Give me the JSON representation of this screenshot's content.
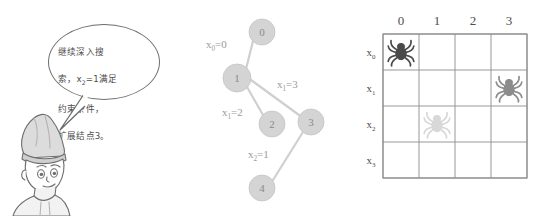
{
  "scene": {
    "title": "Backtracking search tree and n-queens style placement board",
    "background_color": "#ffffff"
  },
  "character": {
    "name": "cartoon-boy-with-pointed-cap",
    "speech_bubble": {
      "text_line_1": "继续深入搜",
      "text_line_2_pre": "索，x",
      "text_line_2_sub": "2",
      "text_line_2_post": "=1满足",
      "text_line_3": "约束条件，",
      "text_line_4": "扩展结点3。",
      "full_text": "继续深入搜索，x2=1满足约束条件，扩展结点3。",
      "border_color": "#6d6d6d",
      "text_color": "#4b4b4b"
    }
  },
  "tree": {
    "node_fill": "#d4d4d4",
    "node_label_color": "#8a8a8a",
    "edge_color": "#cfcfcf",
    "edge_label_color": "#9b9b9b",
    "nodes": [
      {
        "id": "0",
        "label": "0",
        "cx": 72,
        "cy": 32,
        "r": 13
      },
      {
        "id": "1",
        "label": "1",
        "cx": 47,
        "cy": 78,
        "r": 14
      },
      {
        "id": "2",
        "label": "2",
        "cx": 82,
        "cy": 124,
        "r": 13
      },
      {
        "id": "3",
        "label": "3",
        "cx": 121,
        "cy": 122,
        "r": 13
      },
      {
        "id": "4",
        "label": "4",
        "cx": 72,
        "cy": 188,
        "r": 13
      }
    ],
    "edges": [
      {
        "from": "0",
        "to": "1",
        "x1": 63,
        "y1": 41,
        "x2": 56,
        "y2": 69
      },
      {
        "from": "1",
        "to": "2",
        "x1": 57,
        "y1": 87,
        "x2": 73,
        "y2": 115
      },
      {
        "from": "1",
        "to": "3",
        "x1": 61,
        "y1": 80,
        "x2": 109,
        "y2": 115
      },
      {
        "from": "3",
        "to": "4",
        "x1": 113,
        "y1": 132,
        "x2": 83,
        "y2": 180
      }
    ],
    "edge_labels": [
      {
        "var": "x",
        "sub": "0",
        "eq": "=0",
        "x": 16,
        "y": 48
      },
      {
        "var": "x",
        "sub": "1",
        "eq": "=3",
        "x": 87,
        "y": 88
      },
      {
        "var": "x",
        "sub": "1",
        "eq": "=2",
        "x": 32,
        "y": 116
      },
      {
        "var": "x",
        "sub": "2",
        "eq": "=1",
        "x": 58,
        "y": 158
      }
    ]
  },
  "board": {
    "grid_line_color": "#8d8d8d",
    "header_text_color": "#4d4d4d",
    "origin_x": 43,
    "origin_y": 34,
    "cell_size": 36,
    "rows": 4,
    "cols": 4,
    "col_headers": [
      "0",
      "1",
      "2",
      "3"
    ],
    "row_headers": [
      {
        "var": "x",
        "sub": "0"
      },
      {
        "var": "x",
        "sub": "1"
      },
      {
        "var": "x",
        "sub": "2"
      },
      {
        "var": "x",
        "sub": "3"
      }
    ],
    "pieces": [
      {
        "icon": "spider-icon",
        "row": 0,
        "col": 0,
        "color": "#4a4a4a",
        "state": "placed"
      },
      {
        "icon": "spider-icon",
        "row": 1,
        "col": 3,
        "color": "#8c8c8c",
        "state": "placed"
      },
      {
        "icon": "spider-icon",
        "row": 2,
        "col": 1,
        "color": "#d8d8d8",
        "state": "candidate"
      }
    ]
  }
}
